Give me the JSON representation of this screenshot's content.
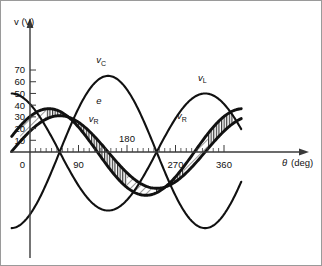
{
  "chart_data": {
    "type": "line",
    "title": "",
    "xlabel": "θ  (deg)",
    "ylabel": "v (V)",
    "xlim": [
      -18,
      400
    ],
    "ylim": [
      -70,
      75
    ],
    "grid": false,
    "legend": "inline-curve-labels",
    "x_ticks": [
      0,
      90,
      180,
      270,
      360
    ],
    "x_tick_labels": [
      "0",
      "90",
      "180",
      "270",
      "360"
    ],
    "y_ticks": [
      0,
      10,
      20,
      30,
      40,
      50,
      60,
      70
    ],
    "y_tick_labels": [
      "0",
      "10",
      "20",
      "30",
      "40",
      "50",
      "60",
      "70"
    ],
    "x_minor_tick_step": 10,
    "series": [
      {
        "name": "e",
        "label": "e",
        "amplitude": 37,
        "phase_deg": 55,
        "label_x_deg": 128,
        "label_y_v": 41
      },
      {
        "name": "vR",
        "label": "v",
        "sublabel": "R",
        "amplitude": 31,
        "phase_deg": 35,
        "label_x_deg": 118,
        "label_y_v": 26,
        "label2_x_deg": 282,
        "label2_y_v": 28
      },
      {
        "name": "vC",
        "label": "v",
        "sublabel": "C",
        "amplitude": 65,
        "phase_deg": -55,
        "label_x_deg": 132,
        "label_y_v": 76
      },
      {
        "name": "vL",
        "label": "v",
        "sublabel": "L",
        "amplitude": 50,
        "phase_deg": 125,
        "label_x_deg": 320,
        "label_y_v": 61
      }
    ],
    "shaded_regions": [
      {
        "name": "e-minus-vR-hatch",
        "between": [
          "e",
          "vR"
        ],
        "pattern": "vertical-hatch"
      }
    ],
    "annotations": []
  },
  "axes": {
    "y_axis_title": "v (V)",
    "x_axis_title_symbol": "θ",
    "x_axis_title_unit": "(deg)"
  }
}
